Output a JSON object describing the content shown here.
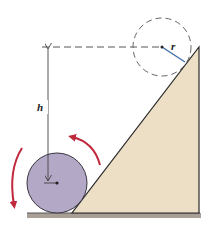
{
  "diagram": {
    "labels": {
      "height": "h",
      "radius": "r"
    },
    "colors": {
      "wedge_fill": "#ecdfc6",
      "wedge_stroke": "#2a2a2a",
      "ball_fill": "#b3a8c6",
      "ball_stroke": "#3a3440",
      "ground": "#a89f97",
      "radius_line": "#3d6fa8",
      "rotation_arrows": "#c0283c",
      "dashed": "#555555"
    },
    "elements": [
      {
        "name": "wedge",
        "type": "right-triangle",
        "points": [
          [
            72,
            213
          ],
          [
            199,
            213
          ],
          [
            199,
            47
          ]
        ]
      },
      {
        "name": "ball",
        "type": "circle",
        "cx": 57,
        "cy": 183,
        "r": 30
      },
      {
        "name": "final-position",
        "type": "dashed-circle",
        "cx": 162,
        "cy": 47,
        "r": 29
      },
      {
        "name": "height-arrow",
        "type": "double-arrow",
        "x": 48,
        "y1": 47,
        "y2": 183
      },
      {
        "name": "reference-line",
        "type": "dashed-line",
        "y": 47,
        "x1": 42,
        "x2": 162
      },
      {
        "name": "radius",
        "type": "line",
        "from": [
          162,
          47
        ],
        "to": [
          185,
          62
        ]
      },
      {
        "name": "rotation-arrows",
        "type": "curved-arrows",
        "direction": "counterclockwise"
      }
    ]
  }
}
